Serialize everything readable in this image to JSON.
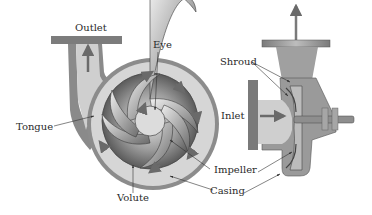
{
  "figure": {
    "views": [
      "front cross-section",
      "side cross-section"
    ]
  },
  "labels": {
    "outlet": "Outlet",
    "eye": "Eye",
    "tongue": "Tongue",
    "volute": "Volute",
    "impeller": "Impeller",
    "casing": "Casing",
    "shroud": "Shroud",
    "inlet": "Inlet"
  },
  "colors": {
    "casing_dark": "#6e6e6e",
    "casing_mid": "#9a9a9a",
    "fluid_light": "#d4d4d4",
    "impeller_dark": "#555555",
    "arrow": "#7a7a7a",
    "text": "#2a2a2a",
    "background": "#ffffff"
  }
}
